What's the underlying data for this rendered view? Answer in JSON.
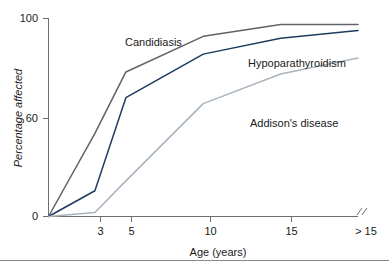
{
  "chart_data": {
    "type": "line",
    "title": "",
    "xlabel": "Age (years)",
    "ylabel": "Percentage affected",
    "x": [
      0,
      3,
      5,
      10,
      15,
      20
    ],
    "xticklabels": [
      "3",
      "5",
      "10",
      "15",
      "> 15"
    ],
    "xtickvalues": [
      3,
      5,
      10,
      15,
      20
    ],
    "yticklabels": [
      "0",
      "60",
      "100"
    ],
    "ytickvalues": [
      0,
      60,
      100
    ],
    "ylim": [
      0,
      100
    ],
    "xlim": [
      0,
      20
    ],
    "grid": false,
    "legend_position": "inline-annotations",
    "axis_break": "//",
    "series": [
      {
        "name": "Candidiasis",
        "color": "#5f6367",
        "values": [
          0,
          42,
          73,
          91,
          97,
          97
        ],
        "label_x": 125,
        "label_y": 46
      },
      {
        "name": "Hypoparathyroidism",
        "color": "#1f3a5f",
        "values": [
          0,
          13,
          60,
          82,
          90,
          94
        ],
        "label_x": 248,
        "label_y": 67
      },
      {
        "name": "Addison's disease",
        "color": "#a9b4bf",
        "values": [
          0,
          2,
          18,
          57,
          72,
          80
        ],
        "label_x": 250,
        "label_y": 127
      }
    ]
  },
  "figure": {
    "alt": "Line chart of percentage affected versus age in years for three conditions"
  }
}
